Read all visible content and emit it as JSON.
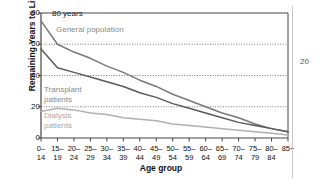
{
  "chart_data": {
    "type": "line",
    "title": "",
    "xlabel": "Age group",
    "ylabel": "Remaining Years to Live",
    "y_unit_label": "80 years",
    "ylim": [
      0,
      80
    ],
    "yticks": [
      0,
      20,
      40,
      60,
      80
    ],
    "grid": "horizontal-dotted",
    "legend_position": "inline-annotations",
    "categories": [
      "0–14",
      "15–19",
      "20–24",
      "25–29",
      "30–34",
      "35–39",
      "40–44",
      "45–49",
      "50–54",
      "55–59",
      "60–64",
      "65–69",
      "70–74",
      "75–79",
      "80–84",
      "85+"
    ],
    "category_lines": [
      [
        "0–",
        "14"
      ],
      [
        "15–",
        "19"
      ],
      [
        "20–",
        "24"
      ],
      [
        "25–",
        "29"
      ],
      [
        "30–",
        "34"
      ],
      [
        "35–",
        "39"
      ],
      [
        "40–",
        "44"
      ],
      [
        "45–",
        "49"
      ],
      [
        "50–",
        "54"
      ],
      [
        "55–",
        "59"
      ],
      [
        "60–",
        "64"
      ],
      [
        "65–",
        "69"
      ],
      [
        "70–",
        "74"
      ],
      [
        "75–",
        "79"
      ],
      [
        "80–",
        "84"
      ],
      [
        "85+",
        ""
      ]
    ],
    "series": [
      {
        "name": "General population",
        "color": "#787878",
        "values": [
          75,
          60,
          55,
          51,
          46,
          42,
          37,
          33,
          28,
          24,
          20,
          16,
          13,
          9,
          6,
          4
        ]
      },
      {
        "name": "Transplant patients",
        "color": "#5a5a5a",
        "values": [
          57,
          45,
          42,
          39,
          36,
          33,
          29,
          26,
          22,
          19,
          16,
          13,
          10,
          8,
          6,
          4
        ]
      },
      {
        "name": "Dialysis patients",
        "color": "#b0b0b0",
        "values": [
          17,
          19,
          18,
          16,
          15,
          13,
          12,
          11,
          9,
          8,
          7,
          6,
          5,
          4,
          3,
          2
        ]
      }
    ],
    "annotations": [
      {
        "text": "General population",
        "series": "General population"
      },
      {
        "text": "Transplant\npatients",
        "series": "Transplant patients"
      },
      {
        "text": "Dialysis\npatients",
        "series": "Dialysis patients"
      }
    ]
  },
  "annotation_labels": {
    "general": "General population",
    "transplant_line1": "Transplant",
    "transplant_line2": "patients",
    "dialysis_line1": "Dialysis",
    "dialysis_line2": "patients"
  },
  "page": {
    "number": "20"
  },
  "colors": {
    "general": "#787878",
    "transplant": "#5a5a5a",
    "dialysis": "#b0b0b0",
    "axis": "#444444",
    "grid": "#555555",
    "text": "#111111",
    "annotation": "#8a8a8a"
  }
}
